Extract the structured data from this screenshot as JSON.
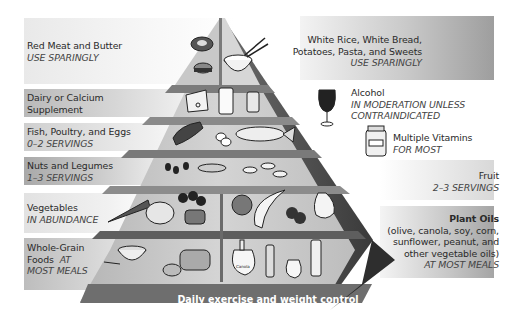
{
  "diagram": {
    "base": "Daily exercise and weight control"
  },
  "left_labels": [
    {
      "id": "red-meat",
      "title": "Red Meat and Butter",
      "subtitle": "USE SPARINGLY"
    },
    {
      "id": "dairy",
      "title": "Dairy or Calcium",
      "title2": "Supplement",
      "subtitle": ""
    },
    {
      "id": "fish",
      "title": "Fish, Poultry, and Eggs",
      "subtitle": "0–2 SERVINGS"
    },
    {
      "id": "nuts",
      "title": "Nuts and Legumes",
      "subtitle": "1–3 SERVINGS"
    },
    {
      "id": "vegetables",
      "title": "Vegetables",
      "subtitle": "IN ABUNDANCE"
    },
    {
      "id": "whole-grain",
      "title": "Whole-Grain",
      "title2": "Foods",
      "title2_italic": "AT",
      "subtitle": "MOST MEALS"
    }
  ],
  "right_labels": [
    {
      "id": "white-rice",
      "title": "White Rice, White Bread,",
      "title2": "Potatoes, Pasta, and Sweets",
      "subtitle": "USE SPARINGLY"
    },
    {
      "id": "alcohol",
      "title": "Alcohol",
      "subtitle": "IN MODERATION UNLESS",
      "subtitle2": "CONTRAINDICATED"
    },
    {
      "id": "vitamins",
      "title": "Multiple Vitamins",
      "subtitle": "FOR MOST"
    },
    {
      "id": "fruit",
      "title": "Fruit",
      "subtitle": "2–3 SERVINGS"
    },
    {
      "id": "plant-oils",
      "title": "Plant Oils",
      "lines": [
        "(olive, canola, soy, corn,",
        "sunflower, peanut, and",
        "other vegetable oils)"
      ],
      "subtitle": "AT MOST MEALS"
    }
  ],
  "icons": {
    "vitamin_bottle_label": "vitamins",
    "canola_label": "Canola",
    "soy_label": "Soy"
  },
  "colors": {
    "band_dark": "#9a9a9a",
    "band_light": "#e4e4e4",
    "pyramid_face": "#c8c8c8",
    "pyramid_side": "#5a5a5a",
    "base_band": "#6e6e6e"
  }
}
